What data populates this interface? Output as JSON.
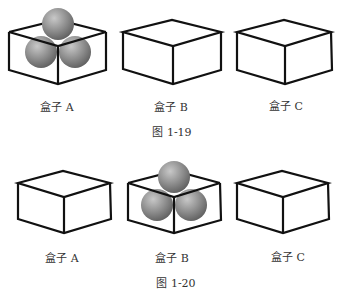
{
  "figures": [
    {
      "caption": "图 1-19",
      "boxes": [
        {
          "label": "盒子 A",
          "has_balls": true,
          "ball_count": 3
        },
        {
          "label": "盒子 B",
          "has_balls": false,
          "ball_count": 0
        },
        {
          "label": "盒子 C",
          "has_balls": false,
          "ball_count": 0
        }
      ]
    },
    {
      "caption": "图 1-20",
      "boxes": [
        {
          "label": "盒子 A",
          "has_balls": false,
          "ball_count": 0
        },
        {
          "label": "盒子 B",
          "has_balls": true,
          "ball_count": 3
        },
        {
          "label": "盒子 C",
          "has_balls": false,
          "ball_count": 0
        }
      ]
    }
  ],
  "colors": {
    "box_stroke": "#111111",
    "ball_light": "#c4c4c4",
    "ball_dark": "#5e5e5e"
  }
}
